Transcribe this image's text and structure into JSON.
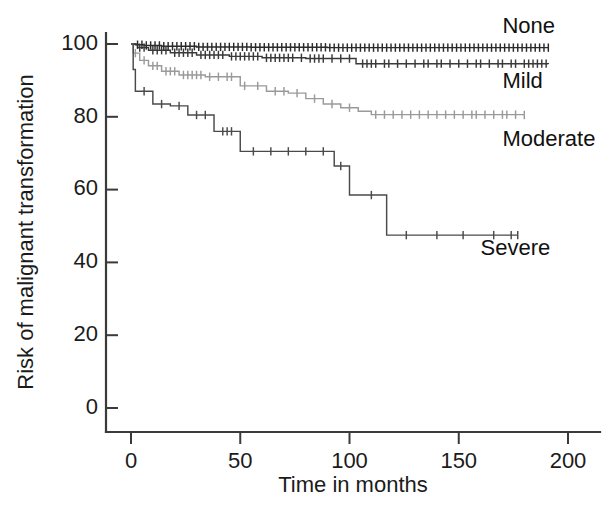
{
  "chart_data": {
    "type": "line",
    "title": "",
    "xlabel": "Time in months",
    "ylabel": "Risk of malignant transformation",
    "xlim": [
      0,
      200
    ],
    "ylim": [
      0,
      100
    ],
    "xticks": [
      0,
      50,
      100,
      150,
      200
    ],
    "yticks": [
      0,
      20,
      40,
      60,
      80,
      100
    ],
    "xtick_labels": [
      "0",
      "50",
      "100",
      "150",
      "200"
    ],
    "ytick_labels": [
      "0",
      "20",
      "40",
      "60",
      "80",
      "100"
    ],
    "grid": false,
    "legend_position": "inline-right-of-curves",
    "plot_style": "kaplan-meier step curves with censoring tick marks",
    "series": [
      {
        "name": "None",
        "label": "None",
        "color": "#2b2b2b",
        "label_x": 170,
        "label_y": 103,
        "end_value": 99.0,
        "steps": [
          [
            0,
            100.0
          ],
          [
            2,
            99.8
          ],
          [
            6,
            99.6
          ],
          [
            14,
            99.4
          ],
          [
            30,
            99.2
          ],
          [
            55,
            99.1
          ],
          [
            90,
            99.0
          ],
          [
            191,
            99.0
          ]
        ],
        "censor_times": [
          3,
          5,
          7,
          9,
          11,
          13,
          15,
          17,
          19,
          21,
          23,
          25,
          27,
          29,
          31,
          33,
          35,
          37,
          39,
          41,
          43,
          45,
          47,
          49,
          51,
          53,
          55,
          57,
          59,
          61,
          63,
          65,
          67,
          69,
          71,
          73,
          75,
          77,
          79,
          81,
          83,
          85,
          87,
          89,
          91,
          93,
          95,
          97,
          99,
          101,
          103,
          105,
          107,
          109,
          111,
          113,
          115,
          117,
          119,
          121,
          123,
          125,
          127,
          129,
          131,
          133,
          135,
          137,
          139,
          141,
          143,
          145,
          147,
          149,
          151,
          153,
          155,
          157,
          159,
          161,
          163,
          165,
          167,
          169,
          171,
          173,
          175,
          177,
          179,
          181,
          183,
          185,
          187,
          189,
          191
        ]
      },
      {
        "name": "Mild",
        "label": "Mild",
        "color": "#3a3a3a",
        "label_x": 170,
        "label_y": 88,
        "end_value": 94.5,
        "steps": [
          [
            0,
            100.0
          ],
          [
            3,
            99.0
          ],
          [
            8,
            98.3
          ],
          [
            18,
            97.6
          ],
          [
            30,
            97.0
          ],
          [
            45,
            96.6
          ],
          [
            60,
            96.2
          ],
          [
            80,
            96.0
          ],
          [
            103,
            96.0
          ],
          [
            103,
            94.6
          ],
          [
            191,
            94.5
          ]
        ],
        "censor_times": [
          4,
          6,
          10,
          12,
          14,
          16,
          20,
          22,
          24,
          26,
          28,
          32,
          34,
          36,
          38,
          40,
          42,
          46,
          48,
          50,
          52,
          54,
          56,
          58,
          62,
          64,
          66,
          68,
          70,
          72,
          74,
          78,
          82,
          84,
          86,
          88,
          92,
          96,
          100,
          106,
          108,
          110,
          112,
          116,
          118,
          122,
          126,
          130,
          134,
          136,
          140,
          142,
          146,
          150,
          154,
          158,
          160,
          164,
          168,
          170,
          174,
          176,
          180,
          182,
          184,
          186,
          188,
          190
        ]
      },
      {
        "name": "Moderate",
        "label": "Moderate",
        "color": "#9a9a9a",
        "label_x": 170,
        "label_y": 72,
        "end_value": 80.5,
        "steps": [
          [
            0,
            100.0
          ],
          [
            1,
            97.5
          ],
          [
            4,
            95.5
          ],
          [
            8,
            94.0
          ],
          [
            14,
            92.5
          ],
          [
            22,
            91.5
          ],
          [
            34,
            91.0
          ],
          [
            50,
            91.0
          ],
          [
            50,
            88.5
          ],
          [
            62,
            88.5
          ],
          [
            62,
            87.0
          ],
          [
            72,
            86.5
          ],
          [
            80,
            85.0
          ],
          [
            88,
            83.5
          ],
          [
            96,
            82.5
          ],
          [
            104,
            81.5
          ],
          [
            110,
            80.6
          ],
          [
            180,
            80.5
          ]
        ],
        "censor_times": [
          2,
          6,
          10,
          12,
          16,
          18,
          20,
          24,
          26,
          28,
          30,
          32,
          36,
          40,
          44,
          46,
          52,
          58,
          66,
          70,
          76,
          84,
          92,
          100,
          112,
          116,
          120,
          124,
          128,
          132,
          136,
          140,
          144,
          148,
          152,
          156,
          158,
          162,
          166,
          170,
          172,
          176,
          180
        ]
      },
      {
        "name": "Severe",
        "label": "Severe",
        "color": "#4a4a4a",
        "label_x": 160,
        "label_y": 42,
        "end_value": 47.5,
        "steps": [
          [
            0,
            100.0
          ],
          [
            1,
            93.0
          ],
          [
            2,
            87.0
          ],
          [
            10,
            87.0
          ],
          [
            10,
            83.5
          ],
          [
            18,
            83.0
          ],
          [
            26,
            80.5
          ],
          [
            38,
            80.5
          ],
          [
            38,
            76.0
          ],
          [
            50,
            76.0
          ],
          [
            50,
            70.5
          ],
          [
            93,
            70.5
          ],
          [
            93,
            66.5
          ],
          [
            100,
            66.5
          ],
          [
            100,
            58.5
          ],
          [
            117,
            58.5
          ],
          [
            117,
            47.5
          ],
          [
            177,
            47.5
          ]
        ],
        "censor_times": [
          6,
          14,
          22,
          30,
          34,
          42,
          44,
          46,
          56,
          64,
          72,
          80,
          88,
          96,
          110,
          126,
          140,
          152,
          166,
          174,
          177
        ]
      }
    ]
  },
  "axes": {
    "x_title": "Time in months",
    "y_title": "Risk of malignant transformation"
  }
}
